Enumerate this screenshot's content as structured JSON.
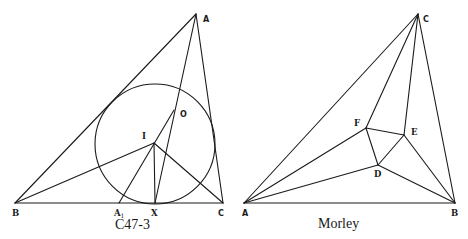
{
  "figures": [
    {
      "id": "left",
      "caption": "C47-3",
      "points": {
        "A": {
          "label": "A",
          "x": 196,
          "y": 14
        },
        "B": {
          "label": "B",
          "x": 15,
          "y": 203
        },
        "C": {
          "label": "C",
          "x": 223,
          "y": 203
        },
        "I": {
          "label": "I",
          "x": 154,
          "y": 143
        },
        "O": {
          "label": "O",
          "x": 174,
          "y": 110
        },
        "A1": {
          "label": "A",
          "sub": "1",
          "x": 119,
          "y": 203
        },
        "X": {
          "label": "X",
          "x": 155,
          "y": 203
        }
      },
      "circle": {
        "cx": 155,
        "cy": 144,
        "r": 60
      },
      "segments": [
        [
          "A",
          "B"
        ],
        [
          "A",
          "C"
        ],
        [
          "B",
          "C"
        ],
        [
          "A",
          "X"
        ],
        [
          "A1",
          "O"
        ],
        [
          "I",
          "B"
        ],
        [
          "I",
          "C"
        ],
        [
          "I",
          "X"
        ]
      ]
    },
    {
      "id": "right",
      "caption": "Morley",
      "points": {
        "A": {
          "label": "A",
          "x": 244,
          "y": 203
        },
        "B": {
          "label": "B",
          "x": 455,
          "y": 203
        },
        "C": {
          "label": "C",
          "x": 418,
          "y": 14
        },
        "D": {
          "label": "D",
          "x": 378,
          "y": 165
        },
        "E": {
          "label": "E",
          "x": 404,
          "y": 135
        },
        "F": {
          "label": "F",
          "x": 366,
          "y": 128
        }
      },
      "segments": [
        [
          "A",
          "B"
        ],
        [
          "A",
          "C"
        ],
        [
          "B",
          "C"
        ],
        [
          "C",
          "F"
        ],
        [
          "C",
          "E"
        ],
        [
          "A",
          "F"
        ],
        [
          "A",
          "D"
        ],
        [
          "B",
          "D"
        ],
        [
          "B",
          "E"
        ],
        [
          "D",
          "E"
        ],
        [
          "E",
          "F"
        ],
        [
          "F",
          "D"
        ]
      ]
    }
  ]
}
